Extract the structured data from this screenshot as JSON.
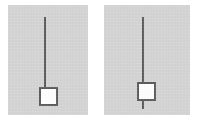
{
  "figure": {
    "caption": "",
    "background_color": "#ffffff",
    "panel_background_color": "#d3d3d3",
    "rod_color": "#595959",
    "bob_fill_color": "#fdfdfd",
    "bob_border_color": "#5a5a5a"
  },
  "panels": [
    {
      "id": "left",
      "label": "",
      "rod": {
        "orientation": "vertical",
        "attachment": "top",
        "extends_below_bob": false
      },
      "bob": {
        "shape": "square",
        "position": "bottom-of-rod"
      }
    },
    {
      "id": "right",
      "label": "",
      "rod": {
        "orientation": "vertical",
        "attachment": "top",
        "extends_below_bob": true
      },
      "bob": {
        "shape": "square",
        "position": "on-rod-above-tip"
      }
    }
  ],
  "chart_data": {
    "type": "diagram",
    "title": "",
    "subtitle": "",
    "xlabel": "",
    "ylabel": "",
    "annotations": [],
    "legend": [],
    "items": [
      {
        "panel": "left",
        "rod_top_y": 12,
        "rod_bottom_y": 82,
        "rod_x": 37,
        "bob_center_x": 40,
        "bob_center_y": 91,
        "bob_size": 19
      },
      {
        "panel": "right",
        "rod_top_y": 12,
        "rod_bottom_y": 104,
        "rod_x": 39,
        "bob_center_x": 42,
        "bob_center_y": 86,
        "bob_size": 19
      }
    ]
  }
}
